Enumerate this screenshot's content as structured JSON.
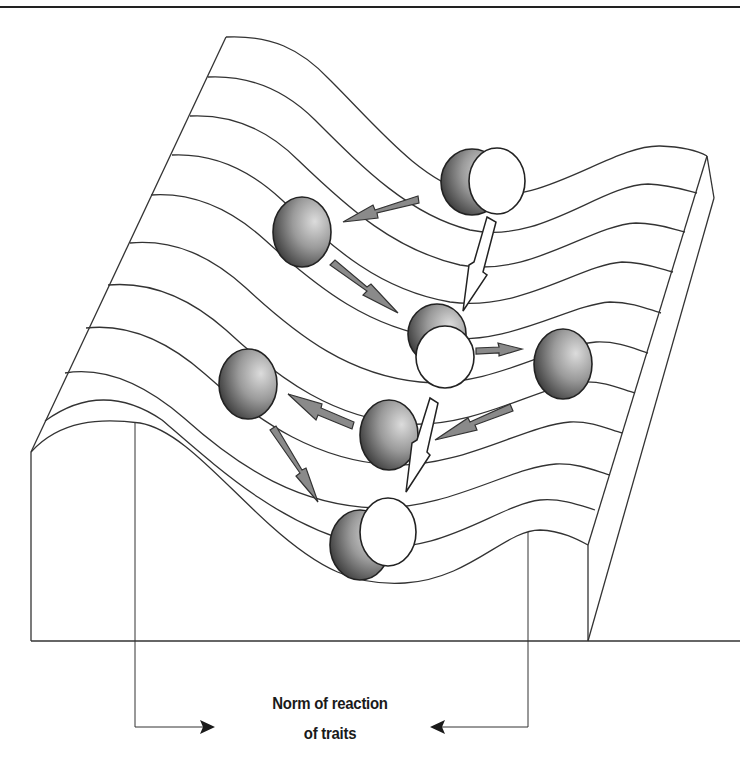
{
  "figure": {
    "type": "Waddington-style landscape diagram",
    "label": {
      "line1": "Norm of reaction",
      "line2": "of traits"
    },
    "elements": {
      "landscape": "3D ridged surface with 11 contour lines forming a valley",
      "gray_balls": 6,
      "white_balls": 3,
      "gray_arrows": 6,
      "white_lightning_arrows": 2,
      "bracket_arrows": 2
    },
    "colors": {
      "line": "#333333",
      "ball_dark": "#2e2e2e",
      "ball_light": "#d4d4d4",
      "arrow_fill": "#8a8a8a",
      "white_ball": "#ffffff"
    }
  }
}
